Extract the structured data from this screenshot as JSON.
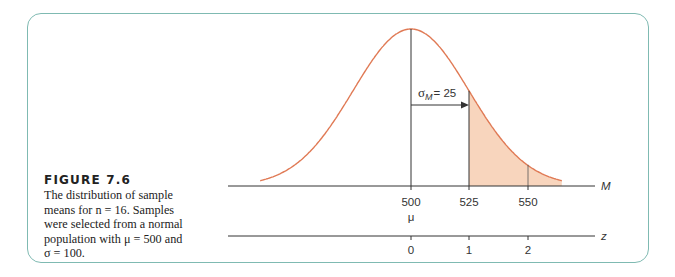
{
  "figure": {
    "title": "FIGURE 7.6",
    "caption_lines": [
      "The distribution of sample",
      "means for n = 16. Samples",
      "were selected from a normal",
      "population with μ = 500 and",
      "σ = 100."
    ]
  },
  "colors": {
    "frame": "#7fbab2",
    "curve": "#e07a55",
    "shade": "#f8d5bd",
    "axis": "#333333"
  },
  "chart_data": {
    "type": "area",
    "title": "The distribution of sample means for n = 16",
    "distribution": "normal",
    "mean": 500,
    "standard_error": 25,
    "shaded_region": "M > 525 (z > 1)",
    "annotation": "σM = 25",
    "axes": [
      {
        "name": "M",
        "ticks": [
          500,
          525,
          550
        ],
        "extra_label_under_500": "μ"
      },
      {
        "name": "z",
        "ticks": [
          0,
          1,
          2
        ]
      }
    ],
    "grid": false
  },
  "labels": {
    "m_axis": "M",
    "z_axis": "z",
    "mu": "μ",
    "sigma_label": "σ",
    "sigma_sub": "M",
    "sigma_value": "= 25",
    "m_ticks": [
      "500",
      "525",
      "550"
    ],
    "z_ticks": [
      "0",
      "1",
      "2"
    ]
  }
}
